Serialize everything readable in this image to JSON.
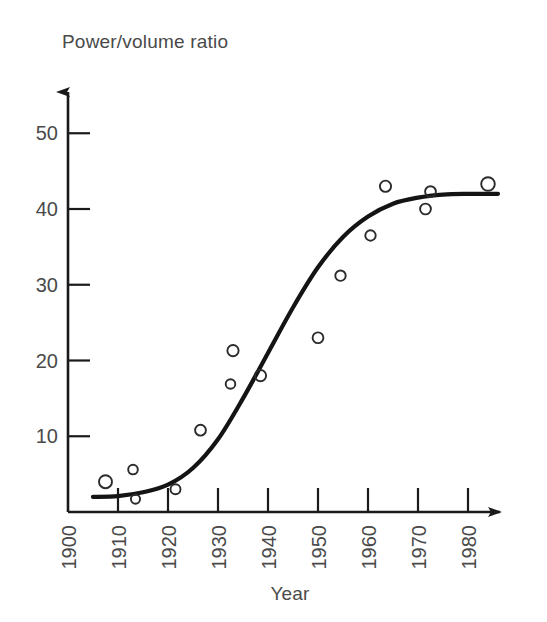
{
  "chart_data": {
    "type": "scatter",
    "title": "",
    "ylabel": "Power/volume ratio",
    "xlabel": "Year",
    "xlim": [
      1900,
      1988
    ],
    "ylim": [
      0,
      55
    ],
    "grid": false,
    "legend": "none",
    "x_ticks": [
      1900,
      1910,
      1920,
      1930,
      1940,
      1950,
      1960,
      1970,
      1980
    ],
    "x_tick_labels": [
      "1900",
      "1910",
      "1920",
      "1930",
      "1940",
      "1950",
      "1960",
      "1970",
      "1980"
    ],
    "x_tick_rotation": 90,
    "y_ticks": [
      10,
      20,
      30,
      40,
      50
    ],
    "y_tick_labels": [
      "10",
      "20",
      "30",
      "40",
      "50"
    ],
    "marker": "open-circle",
    "points": [
      {
        "x": 1907.5,
        "y": 4.0
      },
      {
        "x": 1913.0,
        "y": 5.6
      },
      {
        "x": 1913.5,
        "y": 1.7
      },
      {
        "x": 1921.5,
        "y": 3.0
      },
      {
        "x": 1926.5,
        "y": 10.8
      },
      {
        "x": 1933.0,
        "y": 21.3
      },
      {
        "x": 1932.5,
        "y": 16.9
      },
      {
        "x": 1938.5,
        "y": 18.0
      },
      {
        "x": 1950.0,
        "y": 23.0
      },
      {
        "x": 1954.5,
        "y": 31.2
      },
      {
        "x": 1960.5,
        "y": 36.5
      },
      {
        "x": 1963.5,
        "y": 43.0
      },
      {
        "x": 1971.5,
        "y": 40.0
      },
      {
        "x": 1972.5,
        "y": 42.3
      },
      {
        "x": 1984.0,
        "y": 43.3
      }
    ],
    "fit_curve": {
      "name": "logistic-trend",
      "description": "S-shaped sigmoid trend line",
      "x": [
        1905,
        1910,
        1915,
        1920,
        1925,
        1930,
        1935,
        1940,
        1945,
        1950,
        1955,
        1960,
        1965,
        1970,
        1975,
        1980,
        1986
      ],
      "y": [
        2.0,
        2.1,
        2.6,
        3.6,
        5.8,
        9.6,
        15.0,
        21.0,
        27.0,
        32.3,
        36.3,
        39.0,
        40.7,
        41.5,
        41.9,
        42.0,
        42.0
      ]
    }
  },
  "labels": {
    "y_axis_title": "Power/volume ratio",
    "x_axis_title": "Year"
  },
  "colors": {
    "background": "#ffffff",
    "axis": "#1a1a1a",
    "curve": "#141414",
    "marker": "#2b2b2b",
    "text": "#4a4a4a"
  }
}
